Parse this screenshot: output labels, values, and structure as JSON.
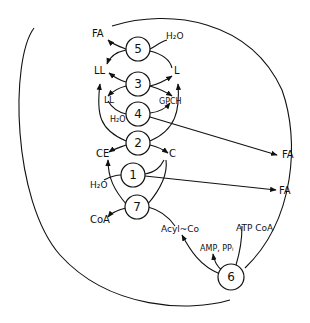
{
  "diagram": {
    "type": "metabolic-cycle",
    "nodes": [
      {
        "id": "5",
        "label": "5",
        "x": 138,
        "y": 49
      },
      {
        "id": "3",
        "label": "3",
        "x": 138,
        "y": 84
      },
      {
        "id": "4",
        "label": "4",
        "x": 138,
        "y": 114
      },
      {
        "id": "2",
        "label": "2",
        "x": 138,
        "y": 143
      },
      {
        "id": "1",
        "label": "1",
        "x": 133,
        "y": 175
      },
      {
        "id": "7",
        "label": "7",
        "x": 137,
        "y": 207
      },
      {
        "id": "6",
        "label": "6",
        "x": 231,
        "y": 277
      }
    ],
    "labels": {
      "fa_top": "FA",
      "h2o_5": "H₂O",
      "ll_upper": "LL",
      "l": "L",
      "ll_lower": "LL",
      "gpch": "GPCH",
      "h2o_4": "H₂O",
      "ce": "CE",
      "c": "C",
      "h2o_1": "H₂O",
      "coa": "CoA",
      "acyl_coa": "Acyl~Co",
      "amp_ppi": "AMP, PPᵢ",
      "atp_coa": "ATP CoA",
      "fa_right_1": "FA",
      "fa_right_2": "FA"
    },
    "edges": [
      {
        "from": "5",
        "to": "FA"
      },
      {
        "from": "H2O",
        "to": "5"
      },
      {
        "from": "5",
        "to": "LL"
      },
      {
        "from": "L",
        "to": "5"
      },
      {
        "from": "3",
        "to": "LL"
      },
      {
        "from": "3",
        "to": "L"
      },
      {
        "from": "LL",
        "to": "3"
      },
      {
        "from": "3",
        "to": "GPCH"
      },
      {
        "from": "LL",
        "to": "4"
      },
      {
        "from": "H2O",
        "to": "4"
      },
      {
        "from": "4",
        "to": "GPCH"
      },
      {
        "from": "4",
        "to": "FA"
      },
      {
        "from": "2",
        "to": "CE"
      },
      {
        "from": "2",
        "to": "C"
      },
      {
        "from": "H2O",
        "to": "1"
      },
      {
        "from": "1",
        "to": "C"
      },
      {
        "from": "1",
        "to": "CE"
      },
      {
        "from": "1",
        "to": "FA"
      },
      {
        "from": "7",
        "to": "CoA"
      },
      {
        "from": "Acyl~Co",
        "to": "7"
      },
      {
        "from": "6",
        "to": "Acyl~Co"
      },
      {
        "from": "6",
        "to": "AMP, PPi"
      },
      {
        "from": "ATP CoA",
        "to": "6"
      }
    ]
  }
}
